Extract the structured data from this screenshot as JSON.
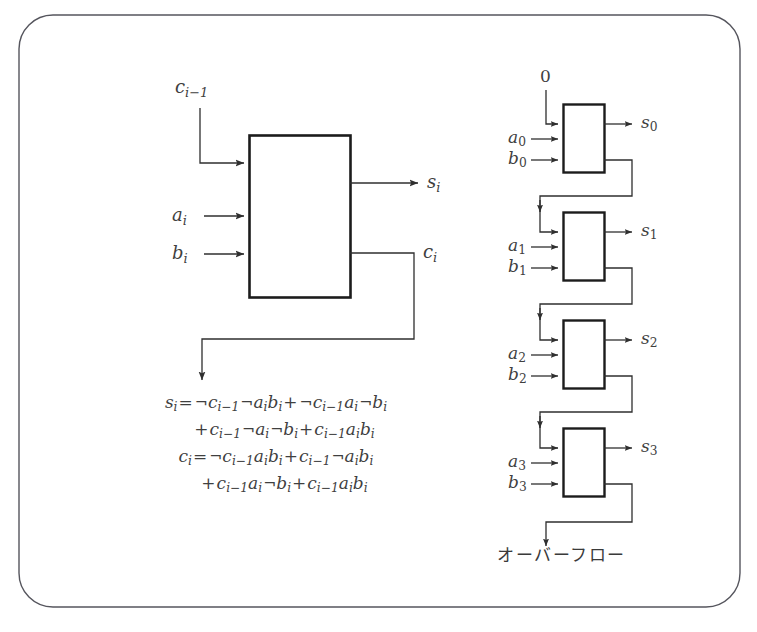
{
  "figure": {
    "frame": {
      "name": "rounded-border-frame",
      "stroke": "#4a4a52",
      "radius": 34
    },
    "colors": {
      "ink": "#3a3a3a",
      "line": "#2f2f2f",
      "thick_box": "#1c1c1c",
      "background": "#ffffff"
    }
  },
  "full_adder": {
    "box_name": "full-adder-block",
    "inputs": [
      {
        "id": "carry-in",
        "base": "c",
        "sub": "i−1",
        "text": "c",
        "subtext": "i−1"
      },
      {
        "id": "a-in",
        "base": "a",
        "sub": "i",
        "text": "a",
        "subtext": "i"
      },
      {
        "id": "b-in",
        "base": "b",
        "sub": "i",
        "text": "b",
        "subtext": "i"
      }
    ],
    "outputs": [
      {
        "id": "sum-out",
        "base": "s",
        "sub": "i",
        "text": "s",
        "subtext": "i"
      },
      {
        "id": "carry-out",
        "base": "c",
        "sub": "i",
        "text": "c",
        "subtext": "i"
      }
    ]
  },
  "formulas": {
    "lines": [
      {
        "id": "sum-equation-line-1",
        "parts": [
          {
            "t": "s",
            "k": "v"
          },
          {
            "t": "i",
            "k": "sub"
          },
          {
            "t": "=",
            "k": "op"
          },
          {
            "t": "¬",
            "k": "neg"
          },
          {
            "t": "c",
            "k": "v"
          },
          {
            "t": "i−1",
            "k": "sub"
          },
          {
            "t": "¬",
            "k": "neg"
          },
          {
            "t": "a",
            "k": "v"
          },
          {
            "t": "i",
            "k": "sub"
          },
          {
            "t": "b",
            "k": "v"
          },
          {
            "t": "i",
            "k": "sub"
          },
          {
            "t": "+",
            "k": "op"
          },
          {
            "t": "¬",
            "k": "neg"
          },
          {
            "t": "c",
            "k": "v"
          },
          {
            "t": "i−1",
            "k": "sub"
          },
          {
            "t": "a",
            "k": "v"
          },
          {
            "t": "i",
            "k": "sub"
          },
          {
            "t": "¬",
            "k": "neg"
          },
          {
            "t": "b",
            "k": "v"
          },
          {
            "t": "i",
            "k": "sub"
          }
        ]
      },
      {
        "id": "sum-equation-line-2",
        "indent": true,
        "parts": [
          {
            "t": "+",
            "k": "op"
          },
          {
            "t": "c",
            "k": "v"
          },
          {
            "t": "i−1",
            "k": "sub"
          },
          {
            "t": "¬",
            "k": "neg"
          },
          {
            "t": "a",
            "k": "v"
          },
          {
            "t": "i",
            "k": "sub"
          },
          {
            "t": "¬",
            "k": "neg"
          },
          {
            "t": "b",
            "k": "v"
          },
          {
            "t": "i",
            "k": "sub"
          },
          {
            "t": "+",
            "k": "op"
          },
          {
            "t": "c",
            "k": "v"
          },
          {
            "t": "i−1",
            "k": "sub"
          },
          {
            "t": "a",
            "k": "v"
          },
          {
            "t": "i",
            "k": "sub"
          },
          {
            "t": "b",
            "k": "v"
          },
          {
            "t": "i",
            "k": "sub"
          }
        ]
      },
      {
        "id": "carry-equation-line-1",
        "parts": [
          {
            "t": "c",
            "k": "v"
          },
          {
            "t": "i",
            "k": "sub"
          },
          {
            "t": "=",
            "k": "op"
          },
          {
            "t": "¬",
            "k": "neg"
          },
          {
            "t": "c",
            "k": "v"
          },
          {
            "t": "i−1",
            "k": "sub"
          },
          {
            "t": "a",
            "k": "v"
          },
          {
            "t": "i",
            "k": "sub"
          },
          {
            "t": "b",
            "k": "v"
          },
          {
            "t": "i",
            "k": "sub"
          },
          {
            "t": "+",
            "k": "op"
          },
          {
            "t": "c",
            "k": "v"
          },
          {
            "t": "i−1",
            "k": "sub"
          },
          {
            "t": "¬",
            "k": "neg"
          },
          {
            "t": "a",
            "k": "v"
          },
          {
            "t": "i",
            "k": "sub"
          },
          {
            "t": "b",
            "k": "v"
          },
          {
            "t": "i",
            "k": "sub"
          }
        ]
      },
      {
        "id": "carry-equation-line-2",
        "indent": true,
        "parts": [
          {
            "t": "+",
            "k": "op"
          },
          {
            "t": "c",
            "k": "v"
          },
          {
            "t": "i−1",
            "k": "sub"
          },
          {
            "t": "a",
            "k": "v"
          },
          {
            "t": "i",
            "k": "sub"
          },
          {
            "t": "¬",
            "k": "neg"
          },
          {
            "t": "b",
            "k": "v"
          },
          {
            "t": "i",
            "k": "sub"
          },
          {
            "t": "+",
            "k": "op"
          },
          {
            "t": "c",
            "k": "v"
          },
          {
            "t": "i−1",
            "k": "sub"
          },
          {
            "t": "a",
            "k": "v"
          },
          {
            "t": "i",
            "k": "sub"
          },
          {
            "t": "b",
            "k": "v"
          },
          {
            "t": "i",
            "k": "sub"
          }
        ]
      }
    ]
  },
  "ripple_adder": {
    "carry_seed_label": "0",
    "stages": [
      {
        "index": 0,
        "a": "a",
        "a_sub": "0",
        "b": "b",
        "b_sub": "0",
        "s": "s",
        "s_sub": "0"
      },
      {
        "index": 1,
        "a": "a",
        "a_sub": "1",
        "b": "b",
        "b_sub": "1",
        "s": "s",
        "s_sub": "1"
      },
      {
        "index": 2,
        "a": "a",
        "a_sub": "2",
        "b": "b",
        "b_sub": "2",
        "s": "s",
        "s_sub": "2"
      },
      {
        "index": 3,
        "a": "a",
        "a_sub": "3",
        "b": "b",
        "b_sub": "3",
        "s": "s",
        "s_sub": "3"
      }
    ],
    "overflow_label": "オーバーフロー"
  }
}
